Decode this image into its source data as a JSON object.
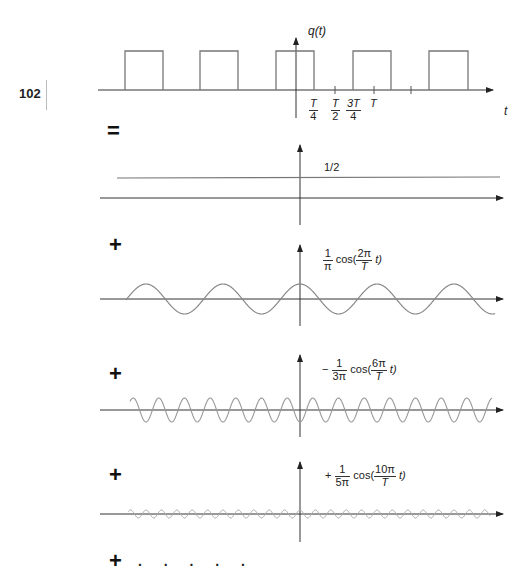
{
  "page": {
    "page_number": "102"
  },
  "operators": {
    "equals": "=",
    "plus": "+",
    "ellipsis": ". . . . ."
  },
  "panels": {
    "square_wave": {
      "y_label": "q(t)",
      "x_label": "t",
      "ticks": [
        {
          "num": "T",
          "den": "4"
        },
        {
          "num": "T",
          "den": "2"
        },
        {
          "num": "3T",
          "den": "4"
        },
        {
          "label": "T"
        }
      ]
    },
    "dc_term": {
      "label": "1/2"
    },
    "harmonic_1": {
      "sign": "",
      "coef_num": "1",
      "coef_den": "π",
      "func": "cos(",
      "arg_num": "2π",
      "arg_den": "T",
      "arg_tail": "t)"
    },
    "harmonic_3": {
      "sign": "−",
      "coef_num": "1",
      "coef_den": "3π",
      "func": "cos(",
      "arg_num": "6π",
      "arg_den": "T",
      "arg_tail": "t)"
    },
    "harmonic_5": {
      "sign": "+",
      "coef_num": "1",
      "coef_den": "5π",
      "func": "cos(",
      "arg_num": "10π",
      "arg_den": "T",
      "arg_tail": "t)"
    }
  },
  "chart_data": [
    {
      "type": "line",
      "title": "q(t) square wave (50% duty cycle, amplitude 1, period T)",
      "xlabel": "t",
      "ylabel": "q(t)",
      "x_tick_labels": [
        "T/4",
        "T/2",
        "3T/4",
        "T"
      ],
      "x_ticks": [
        0.25,
        0.5,
        0.75,
        1.0
      ],
      "pulses": [
        [
          -2.25,
          -1.75
        ],
        [
          -1.25,
          -0.75
        ],
        [
          -0.25,
          0.25
        ],
        [
          0.75,
          1.25
        ],
        [
          1.75,
          2.25
        ]
      ],
      "high": 1,
      "low": 0
    },
    {
      "type": "line",
      "title": "DC component",
      "value": 0.5,
      "annotation": "1/2"
    },
    {
      "type": "line",
      "title": "First harmonic",
      "expression": "(1/π) cos(2π t / T)",
      "amplitude": 0.3183,
      "cycles_per_T": 1
    },
    {
      "type": "line",
      "title": "Third harmonic",
      "expression": "-(1/(3π)) cos(6π t / T)",
      "amplitude": -0.1061,
      "cycles_per_T": 3
    },
    {
      "type": "line",
      "title": "Fifth harmonic",
      "expression": "+(1/(5π)) cos(10π t / T)",
      "amplitude": 0.0637,
      "cycles_per_T": 5
    }
  ]
}
